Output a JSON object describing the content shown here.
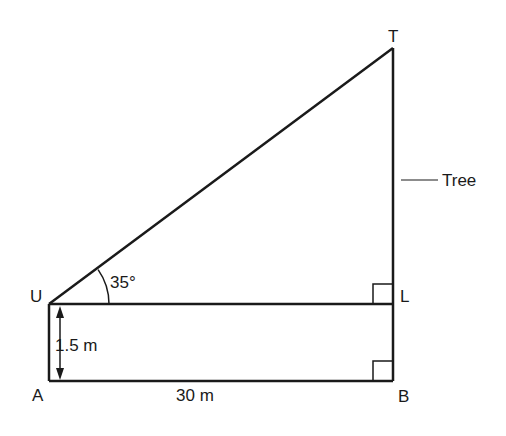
{
  "diagram": {
    "points": {
      "U": {
        "label": "U",
        "x": 49,
        "y": 304
      },
      "A": {
        "label": "A",
        "x": 49,
        "y": 381
      },
      "L": {
        "label": "L",
        "x": 393,
        "y": 304
      },
      "B": {
        "label": "B",
        "x": 393,
        "y": 381
      },
      "T": {
        "label": "T",
        "x": 393,
        "y": 48
      }
    },
    "angle_label": "35°",
    "height_label": "1.5 m",
    "distance_label": "30 m",
    "tree_label": "Tree",
    "colors": {
      "stroke": "#1a1a1a",
      "background": "#ffffff"
    }
  }
}
